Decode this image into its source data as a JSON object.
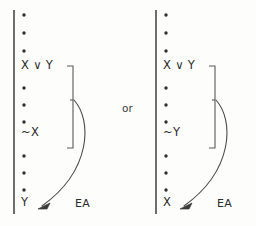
{
  "figure": {
    "kind": "natural-deduction-proof-schema",
    "separator_label": "or",
    "ink_color": "#3a3a3a",
    "text_color": "#2b2b2b",
    "background_color": "#fdfdfc"
  },
  "derivations": [
    {
      "id": "left",
      "scope_line": {
        "x": 14,
        "y_top": 10,
        "y_bottom": 214
      },
      "rows": [
        {
          "kind": "ellipsis-dot",
          "x": 24,
          "y": 15
        },
        {
          "kind": "ellipsis-dot",
          "x": 24,
          "y": 33
        },
        {
          "kind": "ellipsis-dot",
          "x": 24,
          "y": 51
        },
        {
          "kind": "formula",
          "text": "X ∨ Y",
          "x": 21,
          "y": 65
        },
        {
          "kind": "ellipsis-dot",
          "x": 24,
          "y": 88
        },
        {
          "kind": "ellipsis-dot",
          "x": 24,
          "y": 105
        },
        {
          "kind": "ellipsis-dot",
          "x": 24,
          "y": 122
        },
        {
          "kind": "formula",
          "text": "~X",
          "x": 21,
          "y": 132
        },
        {
          "kind": "ellipsis-dot",
          "x": 24,
          "y": 156
        },
        {
          "kind": "ellipsis-dot",
          "x": 24,
          "y": 173
        },
        {
          "kind": "ellipsis-dot",
          "x": 24,
          "y": 190
        },
        {
          "kind": "formula",
          "text": "Y",
          "x": 21,
          "y": 202
        }
      ],
      "bracket": {
        "x": 73,
        "y_top": 66,
        "y_bottom": 148,
        "tick_width": 6,
        "mid_y": 100
      },
      "rule_label": {
        "text": "EA",
        "x": 75,
        "y": 203
      }
    },
    {
      "id": "right",
      "scope_line": {
        "x": 156,
        "y_top": 10,
        "y_bottom": 214
      },
      "rows": [
        {
          "kind": "ellipsis-dot",
          "x": 166,
          "y": 15
        },
        {
          "kind": "ellipsis-dot",
          "x": 166,
          "y": 33
        },
        {
          "kind": "ellipsis-dot",
          "x": 166,
          "y": 51
        },
        {
          "kind": "formula",
          "text": "X ∨ Y",
          "x": 163,
          "y": 65
        },
        {
          "kind": "ellipsis-dot",
          "x": 166,
          "y": 88
        },
        {
          "kind": "ellipsis-dot",
          "x": 166,
          "y": 105
        },
        {
          "kind": "ellipsis-dot",
          "x": 166,
          "y": 122
        },
        {
          "kind": "formula",
          "text": "~Y",
          "x": 163,
          "y": 132
        },
        {
          "kind": "ellipsis-dot",
          "x": 166,
          "y": 156
        },
        {
          "kind": "ellipsis-dot",
          "x": 166,
          "y": 173
        },
        {
          "kind": "ellipsis-dot",
          "x": 166,
          "y": 190
        },
        {
          "kind": "formula",
          "text": "X",
          "x": 163,
          "y": 202
        }
      ],
      "bracket": {
        "x": 215,
        "y_top": 66,
        "y_bottom": 148,
        "tick_width": 6,
        "mid_y": 100
      },
      "rule_label": {
        "text": "EA",
        "x": 217,
        "y": 203
      }
    }
  ],
  "left_labels": {
    "disjunction": "X ∨ Y",
    "negation": "~X",
    "conclusion": "Y",
    "rule": "EA"
  },
  "right_labels": {
    "disjunction": "X ∨ Y",
    "negation": "~Y",
    "conclusion": "X",
    "rule": "EA"
  },
  "separator": {
    "text": "or",
    "x": 122,
    "y": 108
  }
}
